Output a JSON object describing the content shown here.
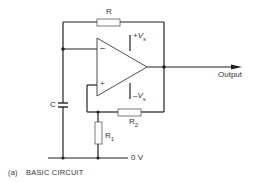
{
  "diagram": {
    "type": "op-amp relaxation oscillator schematic",
    "components": {
      "R": {
        "label": "R"
      },
      "R1": {
        "label": "R",
        "sub": "1"
      },
      "R2": {
        "label": "R",
        "sub": "2"
      },
      "C": {
        "label": "C"
      },
      "opamp": {
        "inverting_input": "–",
        "non_inverting_input": "+",
        "pos_supply": {
          "label": "+V",
          "sub": "s"
        },
        "neg_supply": {
          "label": "–V",
          "sub": "s"
        }
      }
    },
    "output_label": "Output",
    "ground_label": "0 V",
    "caption": {
      "index": "(a)",
      "text": "BASIC CIRCUIT"
    },
    "colors": {
      "wire": "#222222",
      "component_fill": "#ffffff",
      "text": "#333333"
    }
  }
}
